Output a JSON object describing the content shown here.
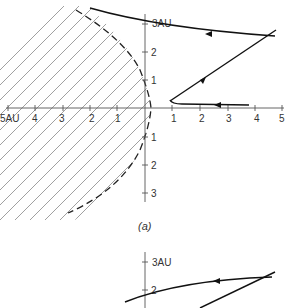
{
  "figure_a": {
    "caption": "(a)",
    "x_axis": {
      "ticks_left": [
        "5AU",
        "4",
        "3",
        "2",
        "1"
      ],
      "ticks_right": [
        "1",
        "2",
        "3",
        "4",
        "5"
      ]
    },
    "y_axis": {
      "ticks_up": [
        "3AU",
        "2",
        "1"
      ],
      "ticks_down": [
        "1",
        "2",
        "3"
      ]
    },
    "shaded_region": "hatched parabolic region bounded by dashed curve, vertex near x=1AU",
    "trajectories": [
      {
        "name": "upper-orbit",
        "direction": "right-to-left"
      },
      {
        "name": "incoming-line",
        "direction": "toward-vertex"
      },
      {
        "name": "lower-orbit",
        "direction": "right-to-left"
      }
    ]
  },
  "figure_b": {
    "y_axis": {
      "ticks_up": [
        "3AU",
        "2"
      ]
    }
  }
}
